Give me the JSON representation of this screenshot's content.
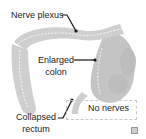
{
  "diagram": {
    "type": "anatomy-illustration",
    "subject": "colon",
    "colors": {
      "tissue": "#cfcfcf",
      "tissue_dark": "#b8b8b8",
      "dashed_nerve_line": "#ffffff",
      "leader_line": "#111111",
      "box_border": "#c9c9c9"
    },
    "labels": {
      "nerve_plexus": "Nerve plexus",
      "enlarged_line1": "Enlarged",
      "enlarged_line2": "colon",
      "no_nerves": "No nerves",
      "collapsed_line1": "Collapsed",
      "collapsed_line2": "rectum"
    }
  }
}
